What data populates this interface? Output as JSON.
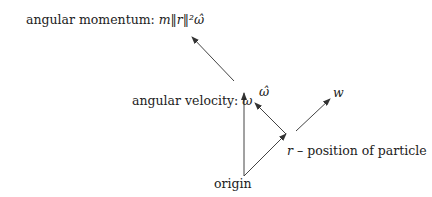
{
  "diagram": {
    "labels": {
      "angular_momentum": {
        "text": "angular momentum: ",
        "math": "m‖r‖²ω̂"
      },
      "angular_velocity": {
        "text": "angular velocity: ",
        "math": "ω"
      },
      "omega_hat": {
        "math": "ω̂"
      },
      "w": {
        "math": "w"
      },
      "position": {
        "math": "r",
        "text": " – position of particle"
      },
      "origin": {
        "text": "origin"
      }
    },
    "arrows": [
      {
        "name": "angular-momentum-vector",
        "from": [
          234,
          81
        ],
        "to": [
          192,
          37
        ]
      },
      {
        "name": "angular-velocity-vector",
        "from": [
          244,
          176
        ],
        "to": [
          244,
          93
        ]
      },
      {
        "name": "position-vector",
        "from": [
          244,
          176
        ],
        "to": [
          286,
          134
        ]
      },
      {
        "name": "omega-hat-vector",
        "from": [
          286,
          134
        ],
        "to": [
          255,
          103
        ]
      },
      {
        "name": "w-vector",
        "from": [
          296,
          131
        ],
        "to": [
          330,
          99
        ]
      }
    ],
    "colors": {
      "stroke": "#333333",
      "text": "#222222"
    }
  }
}
